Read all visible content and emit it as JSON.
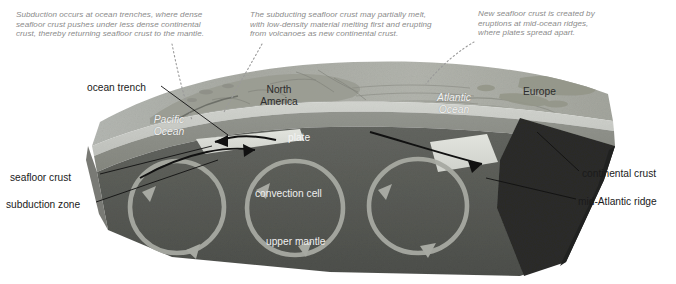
{
  "figure": {
    "colors": {
      "background": "#ffffff",
      "caption_text": "#8b8b8b",
      "label_text": "#1a1a1a",
      "ocean_surface": "#b9bcb8",
      "land_surface": "#9ea096",
      "seafloor_crust": "#c9cbc6",
      "oceanic_layer": "#8c8e8a",
      "upper_mantle": "#5a5c58",
      "deep_mantle": "#4b4d49",
      "continental_crust": "#2a2b29",
      "plate_slab": "#d8dad4",
      "convection_arrow": "#a9aba4",
      "leader_line": "#111111",
      "dotted_leader": "#9a9a9a"
    }
  },
  "captions": [
    {
      "id": "cap-left",
      "name": "caption-subduction",
      "text": "Subduction occurs at ocean trenches, where dense\nseafloor crust pushes under less dense continental\ncrust, thereby returning seafloor crust to the mantle."
    },
    {
      "id": "cap-mid",
      "name": "caption-partial-melt",
      "text": "The subducting seafloor crust may partially melt,\nwith low-density material melting first and erupting\nfrom volcanoes as new continental crust."
    },
    {
      "id": "cap-right",
      "name": "caption-spreading-ridge",
      "text": "New seafloor crust is created by\neruptions at mid-ocean ridges,\nwhere plates spread apart."
    }
  ],
  "callouts": {
    "ocean_trench": "ocean trench",
    "seafloor_crust": "seafloor crust",
    "subduction_zone": "subduction zone",
    "continental_crust": "continental crust",
    "mid_atlantic_ridge": "mid-Atlantic ridge"
  },
  "map_labels": {
    "north_america": "North\nAmerica",
    "europe": "Europe",
    "pacific_ocean": "Pacific\nOcean",
    "atlantic_ocean": "Atlantic\nOcean"
  },
  "interior_labels": {
    "plate": "plate",
    "convection_cell": "convection cell",
    "upper_mantle": "upper mantle"
  }
}
